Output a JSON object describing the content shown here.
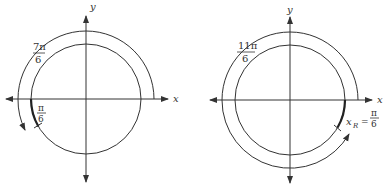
{
  "diagrams": [
    {
      "name": "left",
      "axis_x_label": "x",
      "axis_y_label": "y",
      "angle_label": {
        "numerator": "7π",
        "denominator": "6"
      },
      "reference_label": {
        "numerator": "π",
        "denominator": "6"
      }
    },
    {
      "name": "right",
      "axis_x_label": "x",
      "axis_y_label": "y",
      "angle_label": {
        "numerator": "11π",
        "denominator": "6"
      },
      "reference_label": {
        "prefix": "x",
        "subscript": "R",
        "equals": "=",
        "numerator": "π",
        "denominator": "6"
      }
    }
  ],
  "colors": {
    "stroke": "#333333",
    "background": "#ffffff"
  }
}
